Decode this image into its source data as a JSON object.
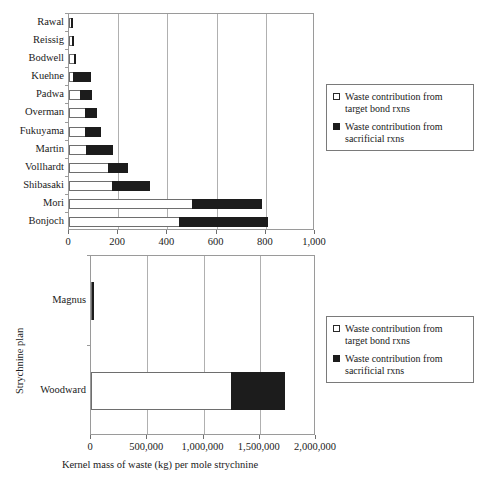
{
  "chart_data": [
    {
      "id": "top-chart",
      "type": "bar",
      "orientation": "horizontal",
      "stacked": true,
      "title": "",
      "xlabel": "",
      "ylabel": "",
      "xlim": [
        0,
        1000
      ],
      "xticks": [
        0,
        200,
        400,
        600,
        800,
        1000
      ],
      "xtick_labels": [
        "0",
        "200",
        "400",
        "600",
        "800",
        "1,000"
      ],
      "categories": [
        "Rawal",
        "Reissig",
        "Bodwell",
        "Kuehne",
        "Padwa",
        "Overman",
        "Fukuyama",
        "Martin",
        "Vollhardt",
        "Shibasaki",
        "Mori",
        "Bonjoch"
      ],
      "grid": "vertical",
      "legend_position": "right",
      "series": [
        {
          "name": "Waste contribution from target bond rxns",
          "color": "#ffffff",
          "values": [
            14,
            16,
            24,
            20,
            49,
            69,
            69,
            73,
            163,
            180,
            505,
            450
          ]
        },
        {
          "name": "Waste contribution from sacrificial rxns",
          "color": "#1c1c1c",
          "values": [
            6,
            9,
            8,
            73,
            49,
            49,
            65,
            110,
            81,
            155,
            285,
            365
          ]
        }
      ],
      "totals": [
        20,
        25,
        32,
        93,
        98,
        118,
        134,
        183,
        244,
        335,
        790,
        815
      ]
    },
    {
      "id": "bottom-chart",
      "type": "bar",
      "orientation": "horizontal",
      "stacked": true,
      "title": "",
      "xlabel": "Kernel mass of waste (kg) per mole strychnine",
      "ylabel": "Strychnine plan",
      "xlim": [
        0,
        2000000
      ],
      "xticks": [
        0,
        500000,
        1000000,
        1500000,
        2000000
      ],
      "xtick_labels": [
        "0",
        "500,000",
        "1,000,000",
        "1,500,000",
        "2,000,000"
      ],
      "categories": [
        "Magnus",
        "Woodward"
      ],
      "grid": "vertical",
      "legend_position": "right",
      "series": [
        {
          "name": "Waste contribution from target bond rxns",
          "color": "#ffffff",
          "values": [
            14000,
            1250000
          ]
        },
        {
          "name": "Waste contribution from sacrificial rxns",
          "color": "#1c1c1c",
          "values": [
            11000,
            480000
          ]
        }
      ],
      "totals": [
        25000,
        1730000
      ]
    }
  ],
  "legends": {
    "top": {
      "items": [
        {
          "marker": "open-square-swatch",
          "label": "Waste contribution from\ntarget bond rxns"
        },
        {
          "marker": "filled-square-swatch",
          "label": "Waste contribution from\nsacrificial rxns"
        }
      ]
    },
    "bottom": {
      "items": [
        {
          "marker": "open-square-swatch",
          "label": "Waste contribution from\ntarget bond rxns"
        },
        {
          "marker": "filled-square-swatch",
          "label": "Waste contribution from\nsacrificial rxns"
        }
      ]
    }
  },
  "colors": {
    "target_bond": "#ffffff",
    "sacrificial": "#1c1c1c",
    "grid": "#b0b0b0",
    "axis": "#6e6e6e",
    "text": "#1a1a1a"
  }
}
